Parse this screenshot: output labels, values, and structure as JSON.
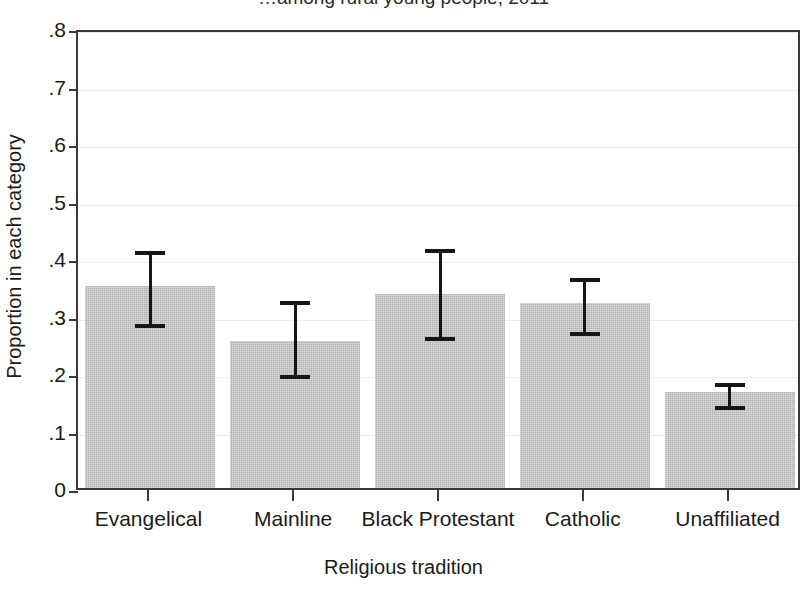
{
  "chart_data": {
    "type": "bar",
    "title": "…among rural young people, 2011",
    "xlabel": "Religious tradition",
    "ylabel": "Proportion in each category",
    "categories": [
      "Evangelical",
      "Mainline",
      "Black Protestant",
      "Catholic",
      "Unaffiliated"
    ],
    "values": [
      0.351,
      0.256,
      0.337,
      0.321,
      0.167
    ],
    "error_low": [
      0.285,
      0.196,
      0.262,
      0.271,
      0.142
    ],
    "error_high": [
      0.419,
      0.332,
      0.422,
      0.372,
      0.19
    ],
    "ylim": [
      0,
      0.8
    ],
    "ytick_labels": [
      "0",
      ".1",
      ".2",
      ".3",
      ".4",
      ".5",
      ".6",
      ".7",
      ".8"
    ],
    "ytick_values": [
      0,
      0.1,
      0.2,
      0.3,
      0.4,
      0.5,
      0.6,
      0.7,
      0.8
    ],
    "grid": true,
    "legend": "none",
    "bar_color": "#b2b2b2",
    "error_color": "#161616",
    "axis_color": "#3a3a3a",
    "grid_color": "#ededed"
  }
}
